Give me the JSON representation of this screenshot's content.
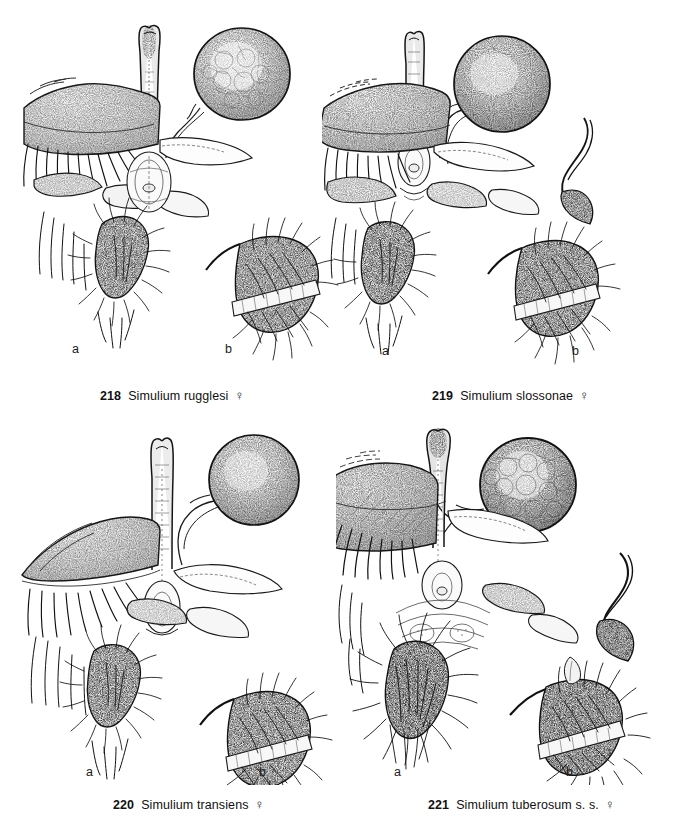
{
  "plate": {
    "background_color": "#ffffff",
    "ink_color": "#1a1a1a",
    "subject": "Female genitalia of Simulium black flies",
    "panel_count": 4
  },
  "figures": [
    {
      "number": "218",
      "genus": "Simulium",
      "species": "rugglesi",
      "sex_symbol": "♀",
      "subpanels": [
        {
          "label": "a",
          "view": "ventral-genitalia"
        },
        {
          "label": "b",
          "view": "lateral-cercus"
        }
      ],
      "spermatheca": {
        "texture": "stippled",
        "reticulate": true,
        "highlight": "pale-center"
      },
      "genital_fork": {
        "shape": "slender-stem-with-clubbed-apex"
      }
    },
    {
      "number": "219",
      "genus": "Simulium",
      "species": "slossonae",
      "sex_symbol": "♀",
      "subpanels": [
        {
          "label": "a",
          "view": "ventral-genitalia"
        },
        {
          "label": "b",
          "view": "lateral-cercus"
        }
      ],
      "spermatheca": {
        "texture": "dense-stipple",
        "reticulate": false,
        "highlight": "pale-center"
      },
      "genital_fork": {
        "shape": "narrow-banded-stem"
      }
    },
    {
      "number": "220",
      "genus": "Simulium",
      "species": "transiens",
      "sex_symbol": "♀",
      "subpanels": [
        {
          "label": "a",
          "view": "ventral-genitalia"
        },
        {
          "label": "b",
          "view": "lateral-cercus"
        }
      ],
      "spermatheca": {
        "texture": "fine-stipple",
        "reticulate": false,
        "highlight": "pale-center"
      },
      "genital_fork": {
        "shape": "tapered-blade-stem"
      }
    },
    {
      "number": "221",
      "genus": "Simulium",
      "species": "tuberosum",
      "subspecies_rank": "s. s.",
      "sex_symbol": "♀",
      "subpanels": [
        {
          "label": "a",
          "view": "ventral-genitalia"
        },
        {
          "label": "b",
          "view": "lateral-cercus"
        }
      ],
      "spermatheca": {
        "texture": "stippled",
        "reticulate": true,
        "highlight": "pale-center"
      },
      "genital_fork": {
        "shape": "clubbed-apex-stem"
      }
    }
  ],
  "captions": {
    "fig218": {
      "number": "218",
      "name": "Simulium rugglesi",
      "sex": "♀"
    },
    "fig219": {
      "number": "219",
      "name": "Simulium slossonae",
      "sex": "♀"
    },
    "fig220": {
      "number": "220",
      "name": "Simulium transiens",
      "sex": "♀"
    },
    "fig221": {
      "number": "221",
      "name": "Simulium tuberosum  s. s.",
      "sex": "♀"
    }
  },
  "sublabels": {
    "p218a": "a",
    "p218b": "b",
    "p219a": "a",
    "p219b": "b",
    "p220a": "a",
    "p220b": "b",
    "p221a": "a",
    "p221b": "b"
  }
}
